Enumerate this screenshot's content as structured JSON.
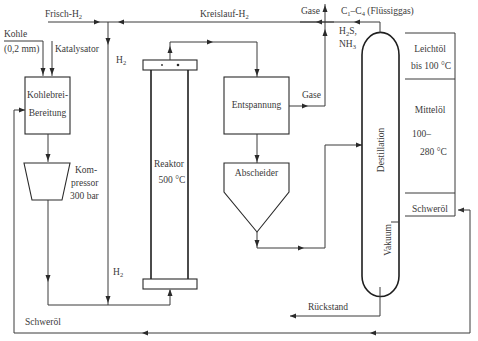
{
  "diagram": {
    "type": "process-flow",
    "colors": {
      "line": "#3a3a3a",
      "text": "#3a3a3a",
      "background": "#ffffff"
    },
    "inputs": {
      "kohle": "Kohle",
      "kohle_size": "(0,2 mm)",
      "katalysator": "Katalysator",
      "frisch_h2": "Frisch-H",
      "frisch_h2_sub": "2",
      "kreislauf_h2": "Kreislauf-H",
      "kreislauf_h2_sub": "2"
    },
    "units": {
      "kohlebrei_line1": "Kohlebrei-",
      "kohlebrei_line2": "Bereitung",
      "kompressor_line1": "Kom-",
      "kompressor_line2": "pressor",
      "kompressor_line3": "300 bar",
      "reaktor": "Reaktor",
      "reaktor_temp": "500 °C",
      "entspannung": "Entspannung",
      "abscheider": "Abscheider",
      "destillation": "Destillation",
      "vakuum": "Vakuum"
    },
    "streams": {
      "h2_top": "H",
      "h2_top_sub": "2",
      "h2_bottom": "H",
      "h2_bottom_sub": "2",
      "gase_top": "Gase",
      "gase_mid": "Gase",
      "c1c4_a": "C",
      "c1c4_a_sub": "1",
      "c1c4_dash": "–C",
      "c1c4_b_sub": "4",
      "c1c4_rest": " (Flüssiggas)",
      "h2s_a": "H",
      "h2s_sub": "2",
      "h2s_b": "S,",
      "nh3_a": "NH",
      "nh3_sub": "3",
      "rueckstand": "Rückstand",
      "schweroel_return": "Schweröl"
    },
    "products": {
      "leichtoel": "Leichtöl",
      "leichtoel_range": "bis 100 °C",
      "mitteloel": "Mittelöl",
      "mitteloel_range1": "100–",
      "mitteloel_range2": "280 °C",
      "schweroel": "Schweröl"
    }
  }
}
